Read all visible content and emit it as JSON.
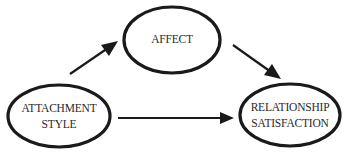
{
  "diagram": {
    "type": "mediation-path-diagram",
    "nodes": {
      "affect": {
        "lines": [
          "AFFECT"
        ]
      },
      "attachment_style": {
        "lines": [
          "ATTACHMENT",
          "STYLE"
        ]
      },
      "relationship_satisfaction": {
        "lines": [
          "RELATIONSHIP",
          "SATISFACTION"
        ]
      }
    },
    "edges": [
      {
        "from": "ATTACHMENT STYLE",
        "to": "AFFECT"
      },
      {
        "from": "AFFECT",
        "to": "RELATIONSHIP SATISFACTION"
      },
      {
        "from": "ATTACHMENT STYLE",
        "to": "RELATIONSHIP SATISFACTION"
      }
    ],
    "colors": {
      "stroke": "#1a1a1a",
      "text": "#2a2a2a",
      "background": "#ffffff"
    }
  }
}
